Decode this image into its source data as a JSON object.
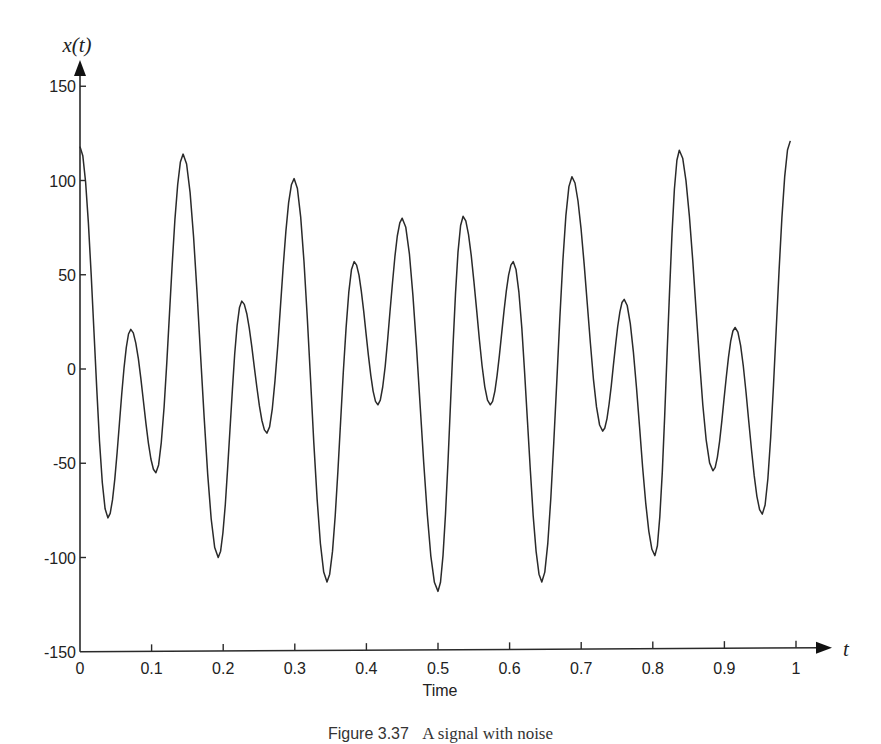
{
  "chart_data": {
    "type": "line",
    "title": "",
    "xlabel": "Time",
    "ylabel": "x(t)",
    "x_axis_symbol": "t",
    "xlim": [
      0,
      1
    ],
    "ylim": [
      -150,
      150
    ],
    "x_ticks": [
      0,
      0.1,
      0.2,
      0.3,
      0.4,
      0.5,
      0.6,
      0.7,
      0.8,
      0.9,
      1
    ],
    "x_tick_labels": [
      "0",
      "0.1",
      "0.2",
      "0.3",
      "0.4",
      "0.5",
      "0.6",
      "0.7",
      "0.8",
      "0.9",
      "1"
    ],
    "y_ticks": [
      150,
      100,
      50,
      0,
      -50,
      -100,
      -150
    ],
    "y_tick_labels": [
      "150",
      "100",
      "50",
      "0",
      "-50",
      "-100",
      "-150"
    ],
    "grid": false,
    "legend": null,
    "series": [
      {
        "name": "x(t)",
        "color": "#2a2a2a",
        "note": "local extrema of the signal (t, value)",
        "x": [
          0,
          0.039,
          0.071,
          0.106,
          0.144,
          0.193,
          0.226,
          0.261,
          0.299,
          0.345,
          0.383,
          0.416,
          0.45,
          0.5,
          0.535,
          0.573,
          0.605,
          0.645,
          0.687,
          0.73,
          0.76,
          0.803,
          0.837,
          0.884,
          0.915,
          0.953,
          0.992
        ],
        "values": [
          118,
          -79,
          21,
          -55,
          114,
          -100,
          36,
          -34,
          101,
          -113,
          57,
          -19,
          80,
          -118,
          81,
          -19,
          57,
          -113,
          102,
          -33,
          37,
          -99,
          116,
          -54,
          22,
          -77,
          121
        ]
      }
    ]
  },
  "figure": {
    "caption_number": "Figure 3.37",
    "caption_text": "A signal with noise"
  }
}
